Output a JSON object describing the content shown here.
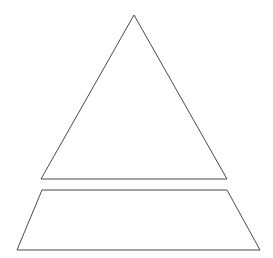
{
  "document": {
    "title": "Pyramid Diagram",
    "background_color": "#ffffff",
    "width": 273,
    "height": 258
  },
  "diagram": {
    "type": "pyramid-outline-diagram",
    "stroke_color": "#4a4a4a",
    "stroke_width": 1,
    "fill": "none",
    "tier_count": 2,
    "tiers": [
      {
        "name": "apex-tier",
        "shape": "triangle",
        "label": "",
        "points": "134,15 227,179 41,179",
        "vertices": [
          {
            "name": "apex",
            "x": 134,
            "y": 15
          },
          {
            "name": "bottom-right",
            "x": 227,
            "y": 179
          },
          {
            "name": "bottom-left",
            "x": 41,
            "y": 179
          }
        ]
      },
      {
        "name": "base-tier",
        "shape": "trapezoid",
        "label": "",
        "points": "42,190 227,190 260,250 17,250",
        "vertices": [
          {
            "name": "top-left",
            "x": 42,
            "y": 190
          },
          {
            "name": "top-right",
            "x": 227,
            "y": 190
          },
          {
            "name": "bottom-right",
            "x": 260,
            "y": 250
          },
          {
            "name": "bottom-left",
            "x": 17,
            "y": 250
          }
        ]
      }
    ],
    "tier_gap_px": 11
  }
}
